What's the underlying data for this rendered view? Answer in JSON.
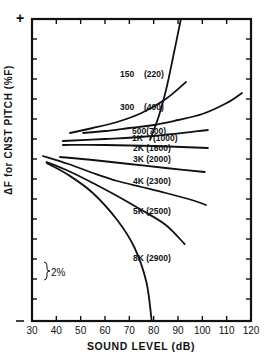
{
  "chart_data": {
    "type": "line",
    "title": "",
    "xlabel": "SOUND LEVEL (dB)",
    "ylabel": "ΔF for CNST PITCH   (%F)",
    "xlim": [
      30,
      120
    ],
    "xticks": [
      30,
      40,
      50,
      60,
      70,
      80,
      90,
      100,
      110,
      120
    ],
    "y_axis_end_labels": {
      "top": "+",
      "bottom": "-"
    },
    "y_scale_annotation": "2%",
    "y_units": "%F relative to reference pitch (one tick = 2%)",
    "grid": false,
    "legend": "inline labels",
    "series": [
      {
        "name": "150 (220)",
        "x": [
          78.5,
          82,
          85,
          88,
          91.2
        ],
        "y": [
          1.7,
          4.0,
          6.6,
          10.0,
          13.8
        ]
      },
      {
        "name": "300 (400)",
        "x": [
          45.6,
          55,
          65,
          75,
          85,
          93.3
        ],
        "y": [
          2.4,
          2.9,
          3.5,
          4.4,
          5.8,
          7.5
        ]
      },
      {
        "name": "500 (700)",
        "x": [
          51,
          60,
          70,
          80,
          90,
          100,
          110,
          116.3
        ],
        "y": [
          2.4,
          2.6,
          2.9,
          3.2,
          3.7,
          4.3,
          5.4,
          6.4
        ]
      },
      {
        "name": "1K (1000)",
        "x": [
          42.7,
          60,
          80,
          102.3
        ],
        "y": [
          1.6,
          1.8,
          2.1,
          2.7
        ]
      },
      {
        "name": "2K (1600)",
        "x": [
          42.7,
          60,
          80,
          102.3
        ],
        "y": [
          1.2,
          1.2,
          1.1,
          0.9
        ]
      },
      {
        "name": "3K (2000)",
        "x": [
          41.5,
          55,
          70,
          85,
          101
        ],
        "y": [
          0.0,
          -0.3,
          -0.7,
          -1.1,
          -1.5
        ]
      },
      {
        "name": "4K (2300)",
        "x": [
          34.5,
          45,
          55,
          65,
          75,
          85,
          97,
          101.5
        ],
        "y": [
          0.1,
          -0.7,
          -1.6,
          -2.4,
          -3.0,
          -3.6,
          -4.4,
          -4.8
        ]
      },
      {
        "name": "5K (2500)",
        "x": [
          36,
          45,
          55,
          65,
          75,
          85,
          92.7
        ],
        "y": [
          -0.5,
          -1.4,
          -2.6,
          -3.9,
          -5.3,
          -6.8,
          -8.7
        ]
      },
      {
        "name": "8K (2900)",
        "x": [
          36,
          45,
          55,
          65,
          72,
          77,
          79.2
        ],
        "y": [
          -0.6,
          -1.8,
          -3.6,
          -6.3,
          -9.0,
          -12.5,
          -16.4
        ]
      }
    ],
    "label_positions": [
      {
        "text": "150",
        "x": 68,
        "y": 48
      },
      {
        "text": "(220)",
        "x": 92,
        "y": 48
      },
      {
        "text": "300",
        "x": 68,
        "y": 81
      },
      {
        "text": "(400)",
        "x": 92,
        "y": 81
      },
      {
        "text": "500(700)",
        "x": 80,
        "y": 105
      },
      {
        "text": "1K",
        "x": 80,
        "y": 112
      },
      {
        "text": "(1000)",
        "x": 101,
        "y": 112
      },
      {
        "text": "2K (1600)",
        "x": 81,
        "y": 122
      },
      {
        "text": "3K (2000)",
        "x": 81,
        "y": 133
      },
      {
        "text": "4K (2300)",
        "x": 81,
        "y": 155
      },
      {
        "text": "5K (2500)",
        "x": 81,
        "y": 185
      },
      {
        "text": "8K (2900)",
        "x": 81,
        "y": 232
      }
    ]
  },
  "labels": {
    "x_axis": "SOUND LEVEL (dB)",
    "y_axis": "ΔF for CNST PITCH   (%F)",
    "y_top": "+",
    "y_bottom": "-",
    "scale": "2%"
  }
}
